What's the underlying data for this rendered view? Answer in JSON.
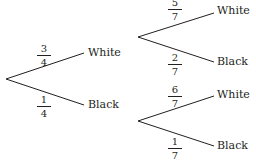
{
  "tree": {
    "root": {
      "branches": [
        {
          "label": "White",
          "probability": {
            "numerator": "3",
            "denominator": "4"
          },
          "children": [
            {
              "label": "White",
              "probability": {
                "numerator": "5",
                "denominator": "7"
              }
            },
            {
              "label": "Black",
              "probability": {
                "numerator": "2",
                "denominator": "7"
              }
            }
          ]
        },
        {
          "label": "Black",
          "probability": {
            "numerator": "1",
            "denominator": "4"
          },
          "children": [
            {
              "label": "White",
              "probability": {
                "numerator": "6",
                "denominator": "7"
              }
            },
            {
              "label": "Black",
              "probability": {
                "numerator": "1",
                "denominator": "7"
              }
            }
          ]
        }
      ]
    }
  },
  "colors": {
    "line": "#231f20",
    "text": "#231f20",
    "background": "#ffffff"
  }
}
